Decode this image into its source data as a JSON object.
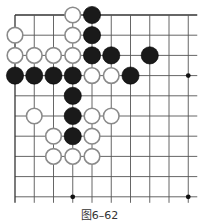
{
  "figure": {
    "caption": "图6–62",
    "type": "go-board-diagram"
  },
  "board": {
    "cols": 10,
    "rows": 10,
    "origin": {
      "x": 15,
      "y": 15
    },
    "spacing": {
      "x": 19.25,
      "y": 20.2
    },
    "extend_right": 9,
    "extend_bottom": 6,
    "line_color": "#555555",
    "edge_color": "#333333",
    "stone_radius": 8.6,
    "black_color": "#1a1a1a",
    "white_fill": "#ffffff",
    "white_stroke": "#8a8a8a"
  },
  "star_points": [
    {
      "col": 9,
      "row": 3
    },
    {
      "col": 3,
      "row": 9
    },
    {
      "col": 9,
      "row": 9
    }
  ],
  "stones": [
    {
      "col": 3,
      "row": 0,
      "color": "white"
    },
    {
      "col": 4,
      "row": 0,
      "color": "black"
    },
    {
      "col": 0,
      "row": 1,
      "color": "white"
    },
    {
      "col": 3,
      "row": 1,
      "color": "white"
    },
    {
      "col": 4,
      "row": 1,
      "color": "black"
    },
    {
      "col": 0,
      "row": 2,
      "color": "white"
    },
    {
      "col": 1,
      "row": 2,
      "color": "white"
    },
    {
      "col": 2,
      "row": 2,
      "color": "white"
    },
    {
      "col": 3,
      "row": 2,
      "color": "white"
    },
    {
      "col": 4,
      "row": 2,
      "color": "black"
    },
    {
      "col": 5,
      "row": 2,
      "color": "black"
    },
    {
      "col": 7,
      "row": 2,
      "color": "black"
    },
    {
      "col": 0,
      "row": 3,
      "color": "black"
    },
    {
      "col": 1,
      "row": 3,
      "color": "black"
    },
    {
      "col": 2,
      "row": 3,
      "color": "black"
    },
    {
      "col": 3,
      "row": 3,
      "color": "black"
    },
    {
      "col": 4,
      "row": 3,
      "color": "white"
    },
    {
      "col": 5,
      "row": 3,
      "color": "white"
    },
    {
      "col": 6,
      "row": 3,
      "color": "black"
    },
    {
      "col": 3,
      "row": 4,
      "color": "black"
    },
    {
      "col": 1,
      "row": 5,
      "color": "white"
    },
    {
      "col": 3,
      "row": 5,
      "color": "black"
    },
    {
      "col": 4,
      "row": 5,
      "color": "white"
    },
    {
      "col": 5,
      "row": 5,
      "color": "white"
    },
    {
      "col": 2,
      "row": 6,
      "color": "white"
    },
    {
      "col": 3,
      "row": 6,
      "color": "black"
    },
    {
      "col": 4,
      "row": 6,
      "color": "white"
    },
    {
      "col": 2,
      "row": 7,
      "color": "white"
    },
    {
      "col": 3,
      "row": 7,
      "color": "white"
    },
    {
      "col": 4,
      "row": 7,
      "color": "white"
    }
  ]
}
